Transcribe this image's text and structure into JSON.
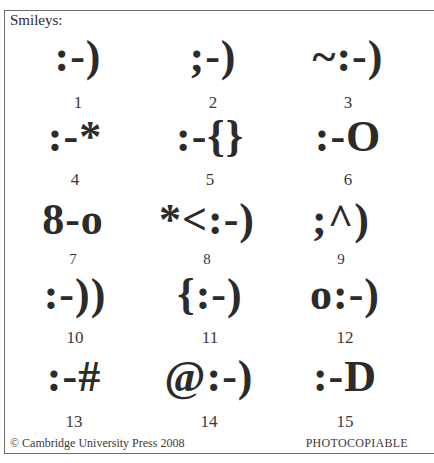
{
  "header": {
    "cut_text": "Chapter 4 Textese — the new way to write"
  },
  "box": {
    "title": "Smileys:"
  },
  "smileys": [
    {
      "symbol": ":-)",
      "number": "1"
    },
    {
      "symbol": ";-)",
      "number": "2"
    },
    {
      "symbol": "~:-)",
      "number": "3"
    },
    {
      "symbol": ":-*",
      "number": "4"
    },
    {
      "symbol": ":-{}",
      "number": "5"
    },
    {
      "symbol": ":-O",
      "number": "6"
    },
    {
      "symbol": "8-o",
      "number": "7"
    },
    {
      "symbol": "*<:-)",
      "number": "8"
    },
    {
      "symbol": ";^)",
      "number": "9"
    },
    {
      "symbol": ":-))",
      "number": "10"
    },
    {
      "symbol": "{:-)",
      "number": "11"
    },
    {
      "symbol": "o:-)",
      "number": "12"
    },
    {
      "symbol": ":-#",
      "number": "13"
    },
    {
      "symbol": "@:-)",
      "number": "14"
    },
    {
      "symbol": ":-D",
      "number": "15"
    }
  ],
  "footer": {
    "copyright": "© Cambridge University Press 2008",
    "notice": "PHOTOCOPIABLE"
  }
}
